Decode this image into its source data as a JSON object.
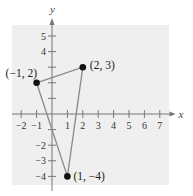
{
  "chart_data": {
    "type": "scatter",
    "title": "",
    "xlabel": "x",
    "ylabel": "y",
    "xlim": [
      -2,
      7
    ],
    "ylim": [
      -4,
      5
    ],
    "grid": false,
    "x_ticks": [
      -2,
      -1,
      1,
      2,
      3,
      4,
      5,
      6,
      7
    ],
    "y_ticks": [
      -4,
      -3,
      -2,
      -1,
      1,
      2,
      3,
      4,
      5
    ],
    "x_tick_labels": [
      "−2",
      "−1",
      "1",
      "2",
      "3",
      "4",
      "5",
      "6",
      "7"
    ],
    "y_tick_labels": [
      "−4",
      "−3",
      "−2",
      "",
      "",
      "",
      "",
      "4",
      "5"
    ],
    "points": [
      {
        "x": -1,
        "y": 2,
        "label": "(−1, 2)"
      },
      {
        "x": 2,
        "y": 3,
        "label": "(2, 3)"
      },
      {
        "x": 1,
        "y": -4,
        "label": "(1, −4)"
      }
    ],
    "polygon": {
      "shape": "triangle",
      "vertices": [
        [
          -1,
          2
        ],
        [
          2,
          3
        ],
        [
          1,
          -4
        ]
      ],
      "closed": true
    },
    "colors": {
      "background_panel": "#efefef",
      "axes": "#777777",
      "edges": "#8a8a8a",
      "points": "#111111"
    }
  }
}
